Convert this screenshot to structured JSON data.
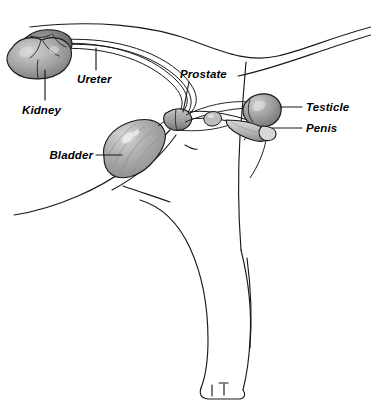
{
  "figure": {
    "view": "left lateral cutaway",
    "background_color": "#ffffff",
    "line_color": "#1a1a1a",
    "label_style": "bold italic"
  },
  "labels": {
    "kidney": "Kidney",
    "ureter": "Ureter",
    "bladder": "Bladder",
    "prostate": "Prostate",
    "testicle": "Testicle",
    "penis": "Penis"
  },
  "organs": [
    {
      "name": "kidney",
      "label": "Kidney",
      "fill": "#9a9a9a",
      "shade": "#6e6e6e"
    },
    {
      "name": "ureter",
      "label": "Ureter",
      "fill": "none",
      "shade": "#1a1a1a"
    },
    {
      "name": "bladder",
      "label": "Bladder",
      "fill": "#ababab",
      "shade": "#8d8d8d"
    },
    {
      "name": "prostate",
      "label": "Prostate",
      "fill": "#9e9e9e",
      "shade": "#7a7a7a"
    },
    {
      "name": "testicle",
      "label": "Testicle",
      "fill": "#a5a5a5",
      "shade": "#767676"
    },
    {
      "name": "penis",
      "label": "Penis",
      "fill": "#c9c9c9",
      "shade": "#8a8a8a"
    }
  ],
  "colors": {
    "outline": "#1a1a1a",
    "organ_gray_light": "#c9c9c9",
    "organ_gray_mid": "#a5a5a5",
    "organ_gray_dark": "#6e6e6e",
    "highlight": "#e8e8e8",
    "page": "#ffffff"
  }
}
